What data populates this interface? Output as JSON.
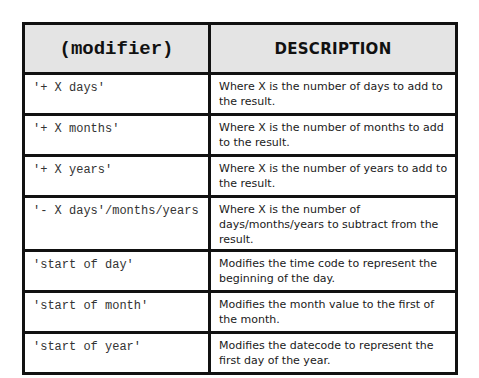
{
  "table": {
    "headers": {
      "modifier": "(modifier)",
      "description": "DESCRIPTION"
    },
    "rows": [
      {
        "modifier": "'+ X days'",
        "description": "Where X is the number of days to add to the result."
      },
      {
        "modifier": "'+ X months'",
        "description": "Where X is the number of months to add to the result."
      },
      {
        "modifier": "'+ X years'",
        "description": "Where X is the number of years to add to the result."
      },
      {
        "modifier": "'- X days'/months/years",
        "description": "Where X is the number of days/months/years to subtract from the result."
      },
      {
        "modifier": "'start of day'",
        "description": "Modifies the time code to represent the beginning of the day."
      },
      {
        "modifier": "'start of month'",
        "description": "Modifies the month value to the first of the month."
      },
      {
        "modifier": "'start of year'",
        "description": "Modifies the datecode to represent the first day of the year."
      }
    ]
  }
}
